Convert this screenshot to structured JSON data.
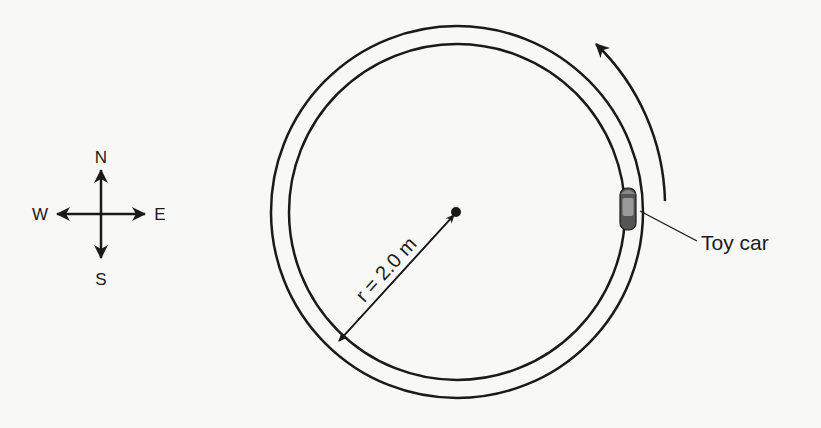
{
  "compass": {
    "north": "N",
    "south": "S",
    "east": "E",
    "west": "W"
  },
  "track": {
    "radius_label": "r = 2.0 m",
    "direction": "counterclockwise"
  },
  "car": {
    "label": "Toy car"
  },
  "colors": {
    "line": "#1a1a1a",
    "background": "#f8f8f6",
    "car_body": "#555555",
    "car_window": "#9a9a9a"
  }
}
